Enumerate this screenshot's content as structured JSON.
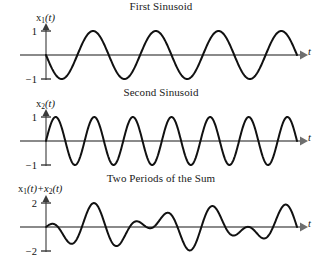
{
  "figure": {
    "background": "#ffffff",
    "curve_color": "#111111",
    "axis_color": "#8a8a8a"
  },
  "panels": [
    {
      "id": "first-sinusoid",
      "title": "First Sinusoid",
      "ylabel": "x",
      "ylabel_sub": "1",
      "ylabel_arg": "(t)",
      "xlabel": "t",
      "ytick_top": "1",
      "ytick_bottom": "−1"
    },
    {
      "id": "second-sinusoid",
      "title": "Second Sinusoid",
      "ylabel": "x",
      "ylabel_sub": "2",
      "ylabel_arg": "(t)",
      "xlabel": "t",
      "ytick_top": "1",
      "ytick_bottom": "−1"
    },
    {
      "id": "sum",
      "title": "Two Periods of the Sum",
      "ylabel": "x",
      "ylabel_sub": "1",
      "ylabel_arg": "(t)+x",
      "ylabel_sub2": "2",
      "ylabel_arg2": "(t)",
      "xlabel": "t",
      "ytick_top": "2",
      "ytick_bottom": "−2"
    }
  ],
  "chart_data": [
    {
      "type": "line",
      "title": "First Sinusoid",
      "xlabel": "t",
      "ylabel": "x1(t)",
      "xlim": [
        0,
        4
      ],
      "ylim": [
        -1.35,
        1.35
      ],
      "yticks": [
        -1,
        1
      ],
      "ytick_labels": [
        "−1",
        "1"
      ],
      "grid": false,
      "legend": false,
      "series": [
        {
          "name": "x1(t)",
          "formula": "-cos(2*pi*t)",
          "amplitude": 1,
          "cycles": 4,
          "phase_deg": 180,
          "samples": 400
        }
      ]
    },
    {
      "type": "line",
      "title": "Second Sinusoid",
      "xlabel": "t",
      "ylabel": "x2(t)",
      "xlim": [
        0,
        4
      ],
      "ylim": [
        -1.35,
        1.35
      ],
      "yticks": [
        -1,
        1
      ],
      "ytick_labels": [
        "−1",
        "1"
      ],
      "grid": false,
      "legend": false,
      "series": [
        {
          "name": "x2(t)",
          "formula": "sin(2*pi*6.5/4*t)",
          "amplitude": 1,
          "cycles": 6.5,
          "phase_deg": 0,
          "samples": 500
        }
      ]
    },
    {
      "type": "line",
      "title": "Two Periods of the Sum",
      "xlabel": "t",
      "ylabel": "x1(t)+x2(t)",
      "xlim": [
        0,
        4
      ],
      "ylim": [
        -2.6,
        2.6
      ],
      "yticks": [
        -2,
        2
      ],
      "ytick_labels": [
        "−2",
        "2"
      ],
      "grid": false,
      "legend": false,
      "series": [
        {
          "name": "x1(t)+x2(t)",
          "formula": "-cos(2*pi*t) + sin(2*pi*6.5/4*t)",
          "amplitude": 2,
          "components": [
            {
              "cycles": 4,
              "phase_deg": 180,
              "amplitude": 1
            },
            {
              "cycles": 6.5,
              "phase_deg": 0,
              "amplitude": 1
            }
          ],
          "samples": 600
        }
      ]
    }
  ]
}
